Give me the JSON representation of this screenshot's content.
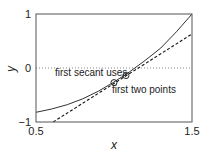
{
  "chart_data": {
    "type": "line",
    "title": "",
    "xlabel": "x",
    "ylabel": "y",
    "xlim": [
      0.5,
      1.5
    ],
    "ylim": [
      -1,
      1
    ],
    "xticks": [
      0.5,
      1.5
    ],
    "xtick_labels": [
      "0.5",
      "1.5"
    ],
    "yticks": [
      -1,
      0,
      1
    ],
    "ytick_labels": [
      "−1",
      "0",
      "1"
    ],
    "grid": false,
    "legend": null,
    "series": [
      {
        "name": "function",
        "style": "solid",
        "x": [
          0.5,
          0.6,
          0.7,
          0.8,
          0.9,
          1.0,
          1.1,
          1.2,
          1.3,
          1.4,
          1.5
        ],
        "y": [
          -0.82,
          -0.76,
          -0.68,
          -0.57,
          -0.43,
          -0.26,
          -0.07,
          0.14,
          0.37,
          0.67,
          1.0
        ]
      },
      {
        "name": "first secant line",
        "style": "dashed",
        "x": [
          0.61,
          1.5
        ],
        "y": [
          -1.0,
          0.63
        ]
      },
      {
        "name": "zero line",
        "style": "dotted",
        "x": [
          0.5,
          1.5
        ],
        "y": [
          0,
          0
        ]
      },
      {
        "name": "secant points",
        "style": "markers-circle",
        "x": [
          1.0,
          1.077
        ],
        "y": [
          -0.27,
          -0.14
        ]
      }
    ],
    "annotations": [
      {
        "text": "first secant uses",
        "x": 0.72,
        "y": -0.09
      },
      {
        "text": "first two points",
        "x": 1.03,
        "y": -0.42
      }
    ]
  },
  "labels": {
    "xlabel": "x",
    "ylabel": "y",
    "xtick_0": "0.5",
    "xtick_1": "1.5",
    "ytick_top": "1",
    "ytick_mid": "0",
    "ytick_bottom": "−1",
    "annotation_1": "first secant uses",
    "annotation_2": "first two points"
  }
}
